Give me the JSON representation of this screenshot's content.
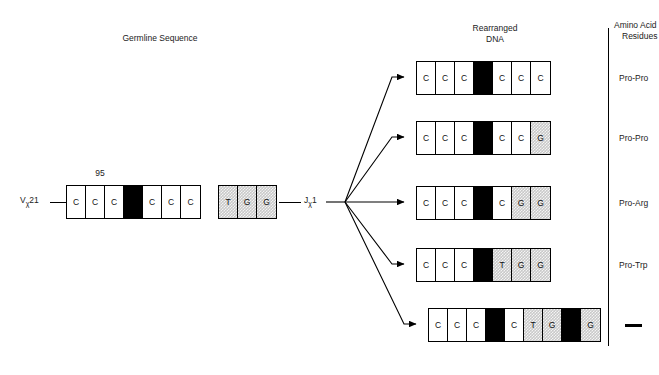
{
  "headers": {
    "germline": "Germline Sequence",
    "rearranged_line1": "Rearranged",
    "rearranged_line2": "DNA",
    "amino_line1": "Amino Acid",
    "amino_line2": "Residues"
  },
  "germline": {
    "position_label": "95",
    "v_gene": "V",
    "v_subscript": "χ",
    "v_number": "21",
    "j_gene": "J",
    "j_subscript": "χ",
    "j_number": "1",
    "v_segment": [
      {
        "base": "C",
        "fill": "white"
      },
      {
        "base": "C",
        "fill": "white"
      },
      {
        "base": "C",
        "fill": "white"
      },
      {
        "base": "",
        "fill": "black"
      },
      {
        "base": "C",
        "fill": "white"
      },
      {
        "base": "C",
        "fill": "white"
      },
      {
        "base": "C",
        "fill": "white"
      }
    ],
    "j_segment": [
      {
        "base": "T",
        "fill": "hatch"
      },
      {
        "base": "G",
        "fill": "hatch"
      },
      {
        "base": "G",
        "fill": "hatch"
      }
    ]
  },
  "rearranged_rows": [
    {
      "residue": "Pro-Pro",
      "cells": [
        {
          "base": "C",
          "fill": "white"
        },
        {
          "base": "C",
          "fill": "white"
        },
        {
          "base": "C",
          "fill": "white"
        },
        {
          "base": "",
          "fill": "black"
        },
        {
          "base": "C",
          "fill": "white"
        },
        {
          "base": "C",
          "fill": "white"
        },
        {
          "base": "C",
          "fill": "white"
        }
      ]
    },
    {
      "residue": "Pro-Pro",
      "cells": [
        {
          "base": "C",
          "fill": "white"
        },
        {
          "base": "C",
          "fill": "white"
        },
        {
          "base": "C",
          "fill": "white"
        },
        {
          "base": "",
          "fill": "black"
        },
        {
          "base": "C",
          "fill": "white"
        },
        {
          "base": "C",
          "fill": "white"
        },
        {
          "base": "G",
          "fill": "hatch"
        }
      ]
    },
    {
      "residue": "Pro-Arg",
      "cells": [
        {
          "base": "C",
          "fill": "white"
        },
        {
          "base": "C",
          "fill": "white"
        },
        {
          "base": "C",
          "fill": "white"
        },
        {
          "base": "",
          "fill": "black"
        },
        {
          "base": "C",
          "fill": "white"
        },
        {
          "base": "G",
          "fill": "hatch"
        },
        {
          "base": "G",
          "fill": "hatch"
        }
      ]
    },
    {
      "residue": "Pro-Trp",
      "cells": [
        {
          "base": "C",
          "fill": "white"
        },
        {
          "base": "C",
          "fill": "white"
        },
        {
          "base": "C",
          "fill": "white"
        },
        {
          "base": "",
          "fill": "black"
        },
        {
          "base": "T",
          "fill": "hatch"
        },
        {
          "base": "G",
          "fill": "hatch"
        },
        {
          "base": "G",
          "fill": "hatch"
        }
      ]
    },
    {
      "residue": "—",
      "residue_is_dash": true,
      "cells": [
        {
          "base": "C",
          "fill": "white"
        },
        {
          "base": "C",
          "fill": "white"
        },
        {
          "base": "C",
          "fill": "white"
        },
        {
          "base": "",
          "fill": "black"
        },
        {
          "base": "C",
          "fill": "white"
        },
        {
          "base": "T",
          "fill": "hatch"
        },
        {
          "base": "G",
          "fill": "hatch"
        },
        {
          "base": "",
          "fill": "black"
        },
        {
          "base": "G",
          "fill": "hatch"
        }
      ]
    }
  ],
  "colors": {
    "ink": "#000000",
    "hatch": "#c9c9c9",
    "page": "#ffffff"
  }
}
